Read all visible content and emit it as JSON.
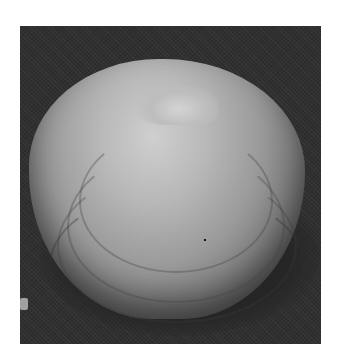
{
  "image": {
    "subject": "clam shell",
    "description": "Grayscale photograph of a single bivalve clam shell on a dark background, showing concentric growth rings",
    "colors": {
      "background": "#2f2f2f",
      "shell_highlight": "#cfcfcf",
      "shell_shadow": "#474747",
      "page": "#ffffff"
    }
  }
}
